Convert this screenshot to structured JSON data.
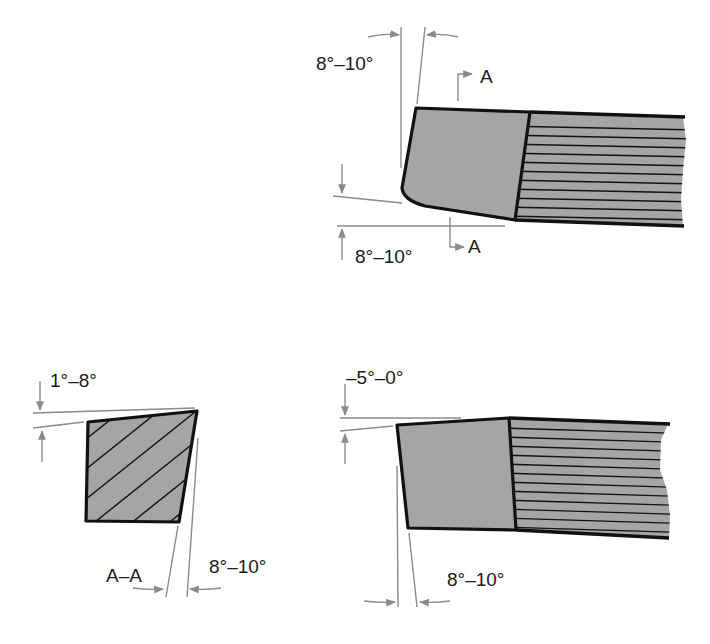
{
  "figure": {
    "colors": {
      "tool_fill": "#a5a5a5",
      "outline": "#111111",
      "dimension_lines": "#8a8a8a",
      "text": "#1a1a1a"
    },
    "top_view": {
      "side_clearance_label": "8°–10°",
      "end_relief_label": "8°–10°",
      "section_marker_top": "A",
      "section_marker_bottom": "A"
    },
    "section_view": {
      "rake_label": "1°–8°",
      "clearance_label": "8°–10°",
      "section_label": "A–A"
    },
    "side_view": {
      "rake_label": "–5°–0°",
      "clearance_label": "8°–10°"
    }
  }
}
